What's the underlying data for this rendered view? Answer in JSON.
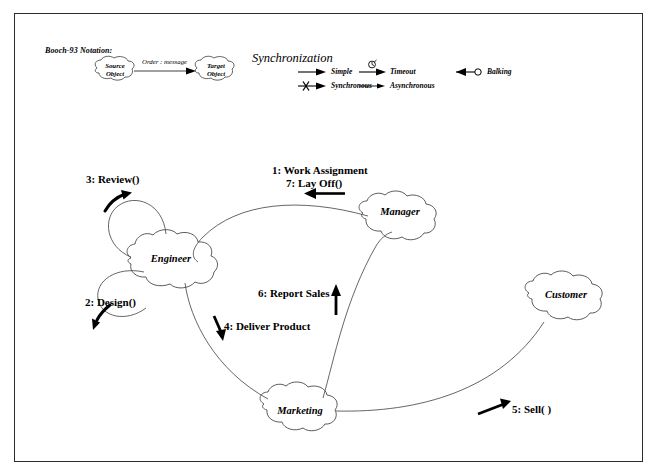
{
  "diagram": {
    "legend": {
      "notation_label": "Booch-93 Notation:",
      "example": {
        "source_line1": "Source",
        "source_line2": "Object",
        "target_line1": "Target",
        "target_line2": "Object",
        "message_label": "Order : message"
      },
      "sync": {
        "heading": "Synchronization",
        "items": [
          {
            "key": "simple",
            "label": "Simple"
          },
          {
            "key": "synchronous",
            "label": "Synchronous"
          },
          {
            "key": "timeout",
            "label": "Timeout"
          },
          {
            "key": "asynchronous",
            "label": "Asynchronous"
          },
          {
            "key": "balking",
            "label": "Balking"
          }
        ]
      }
    },
    "objects": [
      {
        "id": "engineer",
        "name": "Engineer"
      },
      {
        "id": "manager",
        "name": "Manager"
      },
      {
        "id": "customer",
        "name": "Customer"
      },
      {
        "id": "marketing",
        "name": "Marketing"
      }
    ],
    "messages": [
      {
        "seq": "1",
        "label": "1: Work Assignment",
        "from": "manager",
        "to": "engineer"
      },
      {
        "seq": "2",
        "label": "2: Design()",
        "from": "engineer",
        "to": "engineer"
      },
      {
        "seq": "3",
        "label": "3: Review()",
        "from": "engineer",
        "to": "engineer"
      },
      {
        "seq": "4",
        "label": "4: Deliver Product",
        "from": "engineer",
        "to": "marketing"
      },
      {
        "seq": "5",
        "label": "5: Sell( )",
        "from": "marketing",
        "to": "customer"
      },
      {
        "seq": "6",
        "label": "6: Report Sales",
        "from": "marketing",
        "to": "manager"
      },
      {
        "seq": "7",
        "label": "7: Lay Off()",
        "from": "manager",
        "to": "engineer"
      }
    ],
    "colors": {
      "ink": "#000000",
      "line": "#4a4a4a",
      "frame": "#2b2b2b",
      "background": "#ffffff"
    }
  }
}
